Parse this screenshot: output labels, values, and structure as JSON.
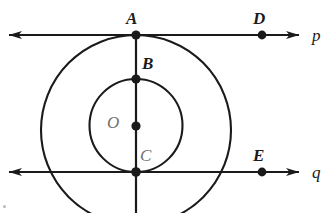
{
  "figure": {
    "width": 335,
    "height": 213,
    "background": "#ffffff",
    "stroke_color": "#1a1a1a",
    "label_color": "#1a1a1a",
    "faded_label_color": "#6f6f6f"
  },
  "lines": [
    {
      "id": "line-p",
      "label": "p",
      "label_x": 312,
      "label_y": 27,
      "y": 35,
      "x_start": 8,
      "x_end": 300,
      "arrows": "both",
      "orientation": "horizontal"
    },
    {
      "id": "line-q",
      "label": "q",
      "label_x": 312,
      "label_y": 164,
      "y": 172,
      "x_start": 8,
      "x_end": 300,
      "arrows": "both",
      "orientation": "horizontal"
    },
    {
      "id": "line-vertical",
      "label": "",
      "label_x": 0,
      "label_y": 0,
      "x": 136,
      "y_start": 35,
      "y_end": 213,
      "arrows": "none",
      "orientation": "vertical"
    }
  ],
  "circles": [
    {
      "id": "outer-circle",
      "cx": 136,
      "cy": 130,
      "r": 95,
      "note": "tangent to line p at A"
    },
    {
      "id": "inner-circle",
      "cx": 136,
      "cy": 125.5,
      "r": 46.5,
      "note": "passes through B and C; tangent to line q at C"
    }
  ],
  "points": [
    {
      "id": "point-a",
      "label": "A",
      "x": 136,
      "y": 35,
      "label_x": 126,
      "label_y": 10,
      "faded": false
    },
    {
      "id": "point-b",
      "label": "B",
      "x": 136,
      "y": 79,
      "label_x": 142,
      "label_y": 55,
      "faded": false
    },
    {
      "id": "point-o",
      "label": "O",
      "x": 136,
      "y": 126,
      "label_x": 107,
      "label_y": 114,
      "faded": true
    },
    {
      "id": "point-c",
      "label": "C",
      "x": 136,
      "y": 172,
      "label_x": 140,
      "label_y": 147,
      "faded": true
    },
    {
      "id": "point-d",
      "label": "D",
      "x": 262,
      "y": 35,
      "label_x": 253,
      "label_y": 10,
      "faded": false
    },
    {
      "id": "point-e",
      "label": "E",
      "x": 262,
      "y": 172,
      "label_x": 253,
      "label_y": 147,
      "faded": false
    }
  ]
}
